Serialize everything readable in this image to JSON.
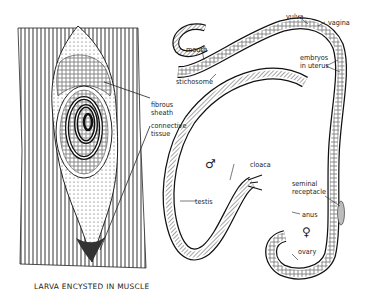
{
  "figure": {
    "caption": "LARVA ENCYSTED IN MUSCLE",
    "labels": {
      "fibrous_sheath_1": "fibrous",
      "fibrous_sheath_2": "sheath",
      "connective_tissue_1": "connective",
      "connective_tissue_2": "tissue",
      "mouth": "mouth",
      "stichosome": "stichosome",
      "vulva": "vulva",
      "vagina": "vagina",
      "embryos_1": "embryos",
      "embryos_2": "in uterus",
      "testis": "testis",
      "cloaca": "cloaca",
      "seminal_1": "seminal",
      "seminal_2": "receptacle",
      "anus": "anus",
      "ovary": "ovary"
    },
    "symbols": {
      "male": "♂",
      "female": "♀"
    }
  },
  "colors": {
    "ink": "#222222",
    "paper": "#ffffff",
    "shade": "#bdbdbd"
  }
}
